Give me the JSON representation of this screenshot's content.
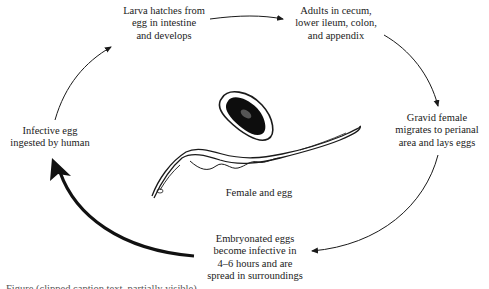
{
  "diagram": {
    "stages": [
      {
        "id": "larva",
        "lines": [
          "Larva hatches from",
          "egg in intestine",
          "and develops"
        ]
      },
      {
        "id": "adults",
        "lines": [
          "Adults in cecum,",
          "lower ileum, colon,",
          "and appendix"
        ]
      },
      {
        "id": "gravid",
        "lines": [
          "Gravid female",
          "migrates to perianal",
          "area and lays eggs"
        ]
      },
      {
        "id": "embryonated",
        "lines": [
          "Embryonated eggs",
          "become infective in",
          "4–6 hours and are",
          "spread in surroundings"
        ]
      },
      {
        "id": "infective",
        "lines": [
          "Infective egg",
          "ingested by human"
        ]
      }
    ],
    "center_illustration": {
      "label": "Female and egg",
      "icons": [
        "egg-icon",
        "female-worm-icon"
      ]
    },
    "arrows": [
      {
        "from": "larva",
        "to": "adults",
        "weight": "thin"
      },
      {
        "from": "adults",
        "to": "gravid",
        "weight": "thin"
      },
      {
        "from": "gravid",
        "to": "embryonated",
        "weight": "thin"
      },
      {
        "from": "embryonated",
        "to": "infective",
        "weight": "bold"
      },
      {
        "from": "infective",
        "to": "larva",
        "weight": "thin"
      }
    ],
    "caption": "Figure (clipped caption text, partially visible)"
  },
  "colors": {
    "ink": "#1a1a1a",
    "background": "#ffffff"
  }
}
